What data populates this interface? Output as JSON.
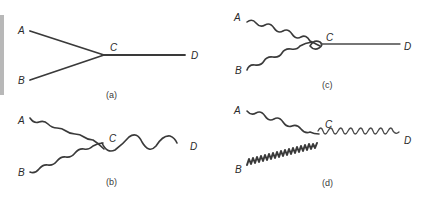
{
  "figure": {
    "panels": [
      {
        "id": "a",
        "caption": "(a)",
        "labels": {
          "A": "A",
          "B": "B",
          "C": "C",
          "D": "D"
        },
        "description": "Two straight lines from A and B meet at vertex C; straight line continues to D"
      },
      {
        "id": "b",
        "caption": "(b)",
        "labels": {
          "A": "A",
          "B": "B",
          "C": "C",
          "D": "D"
        },
        "description": "Two wavy lines from A and B meet at C; a larger-amplitude wavy line continues to D"
      },
      {
        "id": "c",
        "caption": "(c)",
        "labels": {
          "A": "A",
          "B": "B",
          "C": "C",
          "D": "D"
        },
        "description": "Two wavy lines from A and B meet at C with a small loop; straight line continues to D"
      },
      {
        "id": "d",
        "caption": "(d)",
        "labels": {
          "A": "A",
          "B": "B",
          "C": "C",
          "D": "D"
        },
        "description": "Wavy line from A and tightly coiled line from B meet at C; small-amplitude wavy line continues to D"
      }
    ]
  }
}
